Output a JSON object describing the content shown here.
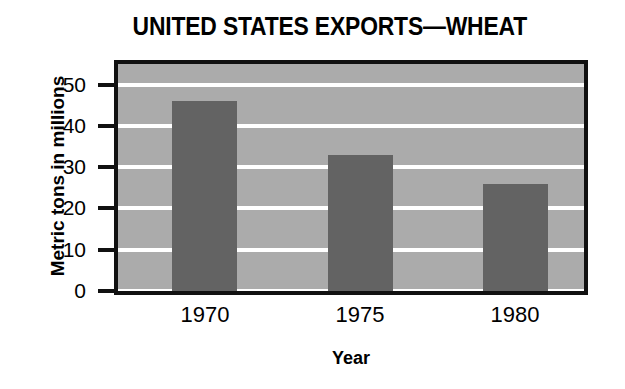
{
  "chart_data": {
    "type": "bar",
    "title": "UNITED STATES EXPORTS—WHEAT",
    "xlabel": "Year",
    "ylabel": "Metric tons in millions",
    "categories": [
      "1970",
      "1975",
      "1980"
    ],
    "values": [
      46,
      33,
      26
    ],
    "series": [
      {
        "name": "United States wheat exports",
        "values": [
          46,
          33,
          26
        ]
      }
    ],
    "ylim": [
      0,
      55
    ],
    "yticks": [
      0,
      10,
      20,
      30,
      40,
      50
    ],
    "ytick_labels": [
      "0",
      "10",
      "20",
      "30",
      "40",
      "50"
    ],
    "xtick_labels": [
      "1970",
      "1975",
      "1980"
    ],
    "grid": "horizontal",
    "legend": "none",
    "colors": {
      "bar": "#636363",
      "plot_background": "#ababab",
      "gridline": "#ffffff",
      "frame": "#111111",
      "text": "#000000",
      "page_background": "#ffffff"
    }
  }
}
